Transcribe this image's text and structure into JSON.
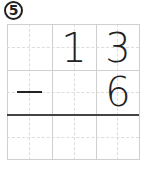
{
  "problem": {
    "number": "5",
    "operator": "−",
    "top_row": [
      "",
      "",
      "1",
      "3"
    ],
    "bottom_row": [
      "−",
      "",
      "",
      "6"
    ],
    "minuend": "13",
    "subtrahend": "6",
    "answer": ""
  },
  "grid": {
    "columns": 6,
    "rows": 6,
    "line_color": "#cfcfcf",
    "rule_color": "#444444"
  }
}
